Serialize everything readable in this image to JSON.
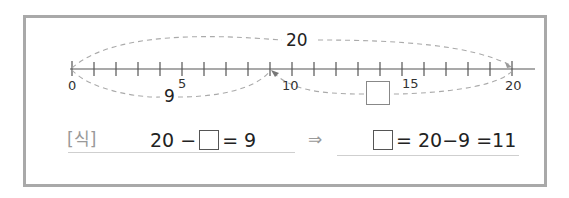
{
  "number_line": {
    "min": 0,
    "max": 20,
    "tick_step": 1,
    "labels": [
      {
        "value": 0,
        "text": "0"
      },
      {
        "value": 5,
        "text": "5"
      },
      {
        "value": 10,
        "text": "10"
      },
      {
        "value": 15,
        "text": "15"
      },
      {
        "value": 20,
        "text": "20"
      }
    ]
  },
  "arcs": {
    "top": {
      "from": 0,
      "to": 20,
      "label": "20"
    },
    "bottom_left": {
      "from": 0,
      "to": 9,
      "label": "9"
    },
    "bottom_right": {
      "from": 20,
      "to": 9,
      "label": "unknown-box"
    }
  },
  "equation": {
    "prefix_label": "[식]",
    "left_part1": "20 −",
    "left_part2": "= 9",
    "implies": "⇒",
    "right_part": "= 20−9 =11"
  },
  "colors": {
    "frame": "#a9a9a9",
    "dashed": "#aaaaaa",
    "axis": "#555555"
  }
}
